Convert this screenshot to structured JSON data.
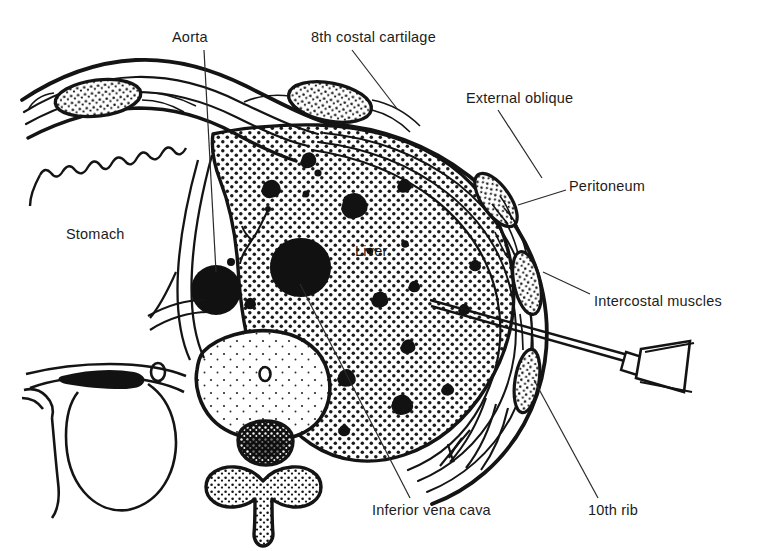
{
  "figure": {
    "background_color": "#ffffff",
    "ink_color": "#161616",
    "stipple_color": "#1a1a1a",
    "view": "transverse cross-section, right side of body on the right of the image"
  },
  "labels": [
    {
      "id": "aorta",
      "text": "Aorta",
      "x": 172,
      "y": 30,
      "anchor": "start",
      "leader": {
        "from_x": 204,
        "from_y": 50,
        "to_x": 216,
        "to_y": 272
      },
      "points_to": "aorta-lumen"
    },
    {
      "id": "eighth-costal-cartilage",
      "text": "8th costal cartilage",
      "x": 311,
      "y": 30,
      "anchor": "start",
      "leader": {
        "from_x": 352,
        "from_y": 50,
        "to_x": 398,
        "to_y": 110
      },
      "points_to": "costal-cartilage-8"
    },
    {
      "id": "external-oblique",
      "text": "External oblique",
      "x": 466,
      "y": 91,
      "anchor": "start",
      "leader": {
        "from_x": 498,
        "from_y": 110,
        "to_x": 542,
        "to_y": 178
      },
      "points_to": "external-oblique-muscle"
    },
    {
      "id": "peritoneum",
      "text": "Peritoneum",
      "x": 569,
      "y": 179,
      "anchor": "start",
      "leader": {
        "from_x": 566,
        "from_y": 190,
        "to_x": 518,
        "to_y": 205
      },
      "points_to": "peritoneum-line"
    },
    {
      "id": "intercostal-muscles",
      "text": "Intercostal muscles",
      "x": 594,
      "y": 294,
      "anchor": "start",
      "leader": {
        "from_x": 590,
        "from_y": 294,
        "to_x": 543,
        "to_y": 272
      },
      "points_to": "intercostal-muscle-band"
    },
    {
      "id": "stomach",
      "text": "Stomach",
      "x": 66,
      "y": 227,
      "anchor": "start",
      "leader": null,
      "points_to": "stomach-cavity"
    },
    {
      "id": "liver",
      "text": "Liver",
      "x": 355,
      "y": 244,
      "anchor": "start",
      "leader": null,
      "points_to": "liver-parenchyma"
    },
    {
      "id": "inferior-vena-cava",
      "text": "Inferior vena cava",
      "x": 372,
      "y": 503,
      "anchor": "start",
      "leader": {
        "from_x": 410,
        "from_y": 498,
        "to_x": 300,
        "to_y": 284
      },
      "points_to": "ivc-lumen"
    },
    {
      "id": "tenth-rib",
      "text": "10th rib",
      "x": 588,
      "y": 503,
      "anchor": "start",
      "leader": {
        "from_x": 598,
        "from_y": 498,
        "to_x": 534,
        "to_y": 380
      },
      "points_to": "rib-10"
    }
  ],
  "structures": [
    {
      "id": "liver-parenchyma",
      "name": "Liver",
      "fill": "stipple",
      "description": "large stippled organ filling right-centre of section"
    },
    {
      "id": "stomach-cavity",
      "name": "Stomach",
      "fill": "white",
      "description": "unshaded cavity at left with rugose inner wall"
    },
    {
      "id": "aorta-lumen",
      "name": "Aorta",
      "fill": "solid-black",
      "cx": 216,
      "cy": 290,
      "r": 25
    },
    {
      "id": "ivc-lumen",
      "name": "Inferior vena cava",
      "fill": "solid-black",
      "cx": 301,
      "cy": 266,
      "r": 28
    },
    {
      "id": "vertebral-body",
      "name": "Vertebral body",
      "fill": "sparse-stipple"
    },
    {
      "id": "spinal-canal",
      "name": "Spinal canal",
      "fill": "solid-black-with-speckle"
    },
    {
      "id": "spinous-process",
      "name": "Spinous process",
      "fill": "coarse-stipple"
    },
    {
      "id": "costal-cartilage-8",
      "name": "8th costal cartilage",
      "fill": "speckled-oval"
    },
    {
      "id": "rib-upper-left",
      "name": "Rib cross-section (left)",
      "fill": "speckled-oval"
    },
    {
      "id": "rib-9",
      "name": "Rib cross-section",
      "fill": "speckled-oval"
    },
    {
      "id": "rib-10",
      "name": "10th rib",
      "fill": "speckled-oval"
    },
    {
      "id": "external-oblique-muscle",
      "name": "External oblique",
      "fill": "white-band"
    },
    {
      "id": "intercostal-muscle-band",
      "name": "Intercostal muscles",
      "fill": "white-band"
    },
    {
      "id": "peritoneum-line",
      "name": "Peritoneum",
      "fill": "thin-line"
    },
    {
      "id": "biopsy-needle",
      "name": "Biopsy needle and hub",
      "fill": "outline",
      "tip_x": 430,
      "tip_y": 300,
      "hub_x": 662,
      "hub_y": 366
    }
  ]
}
